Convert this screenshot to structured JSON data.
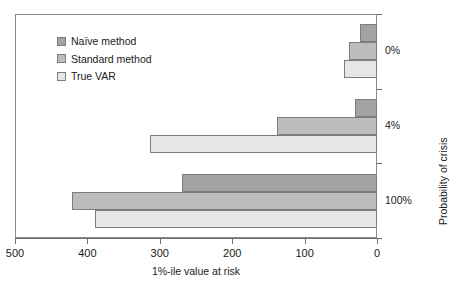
{
  "chart_data": {
    "type": "bar",
    "orientation": "horizontal",
    "title": "",
    "xlabel": "1%-ile value at risk",
    "ylabel": "Probability of crisis",
    "categories": [
      "0%",
      "4%",
      "100%"
    ],
    "series": [
      {
        "name": "Naïve method",
        "color": "#a3a3a3",
        "values": [
          24,
          31,
          269
        ]
      },
      {
        "name": "Standard method",
        "color": "#bdbdbd",
        "values": [
          39,
          138,
          421
        ]
      },
      {
        "name": "True VAR",
        "color": "#e6e6e6",
        "values": [
          45,
          314,
          389
        ]
      }
    ],
    "xlim": [
      500,
      0
    ],
    "x_axis_reversed": true,
    "xticks": [
      500,
      400,
      300,
      200,
      100,
      0
    ],
    "xtick_labels": [
      "500",
      "400",
      "300",
      "200",
      "100",
      "0"
    ],
    "ytick_labels": [
      "0%",
      "4%",
      "100%"
    ],
    "grid": false,
    "legend_position": "top-left",
    "legend_entries": [
      "Naïve method",
      "Standard method",
      "True VAR"
    ],
    "frame": true,
    "bar_border_color": "#7d7d7d",
    "axis_color": "#6e6e6e",
    "background": "#ffffff"
  },
  "legend": {
    "items": [
      {
        "label": "Naïve method"
      },
      {
        "label": "Standard method"
      },
      {
        "label": "True VAR"
      }
    ]
  },
  "axes": {
    "x": {
      "title": "1%-ile value at risk",
      "ticks": [
        {
          "label": "500"
        },
        {
          "label": "400"
        },
        {
          "label": "300"
        },
        {
          "label": "200"
        },
        {
          "label": "100"
        },
        {
          "label": "0"
        }
      ]
    },
    "y": {
      "title": "Probability of crisis",
      "categories": [
        {
          "label": "0%"
        },
        {
          "label": "4%"
        },
        {
          "label": "100%"
        }
      ]
    }
  }
}
